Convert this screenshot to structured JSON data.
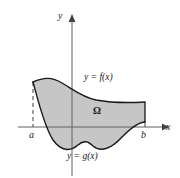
{
  "figure": {
    "axes": {
      "y_axis_label": "y",
      "x_axis_label": "x",
      "left_bound_label": "a",
      "right_bound_label": "b"
    },
    "region_label": "Ω",
    "upper_curve_label": "y = f(x)",
    "lower_curve_label": "y = g(x)",
    "colors": {
      "fill": "#c6c6c6",
      "stroke": "#1a1a1a",
      "axis": "#555555",
      "dashed": "#555555",
      "background": "#ffffff"
    }
  },
  "chart_data": {
    "type": "area",
    "title": "",
    "xlabel": "x",
    "ylabel": "y",
    "grid": false,
    "legend": "none",
    "annotations": [
      {
        "text": "y = f(x)",
        "x": 84,
        "y": 73
      },
      {
        "text": "y = g(x)",
        "x": 67,
        "y": 152
      },
      {
        "text": "Ω",
        "x": 93,
        "y": 106
      },
      {
        "text": "a",
        "x": 29,
        "y": 130
      },
      {
        "text": "b",
        "x": 141,
        "y": 130
      }
    ],
    "axis_pixels": {
      "x_axis_y": 127,
      "y_axis_x": 72,
      "x_axis_start": 18,
      "x_axis_end": 167,
      "y_axis_top": 14,
      "y_axis_bottom": 176
    },
    "bounds": {
      "a_px": 33,
      "b_px": 145
    },
    "series": [
      {
        "name": "f",
        "path": "M 33 82 C 44 77, 52 77, 62 83 C 74 90, 82 97, 96 100 C 112 103, 128 103, 145 102"
      },
      {
        "name": "g",
        "path": "M 33 82 C 38 100, 44 126, 53 140 C 61 151, 70 152, 78 145 C 84 140, 88 141, 93 146 C 101 153, 112 148, 122 137 C 132 127, 139 122, 145 122"
      }
    ],
    "region_fill_path": "M 33 82 C 44 77, 52 77, 62 83 C 74 90, 82 97, 96 100 C 112 103, 128 103, 145 102 L 145 122 C 139 122, 132 127, 122 137 C 112 148, 101 153, 93 146 C 88 141, 84 140, 78 145 C 70 152, 61 151, 53 140 C 44 126, 38 100, 33 82 Z"
  }
}
